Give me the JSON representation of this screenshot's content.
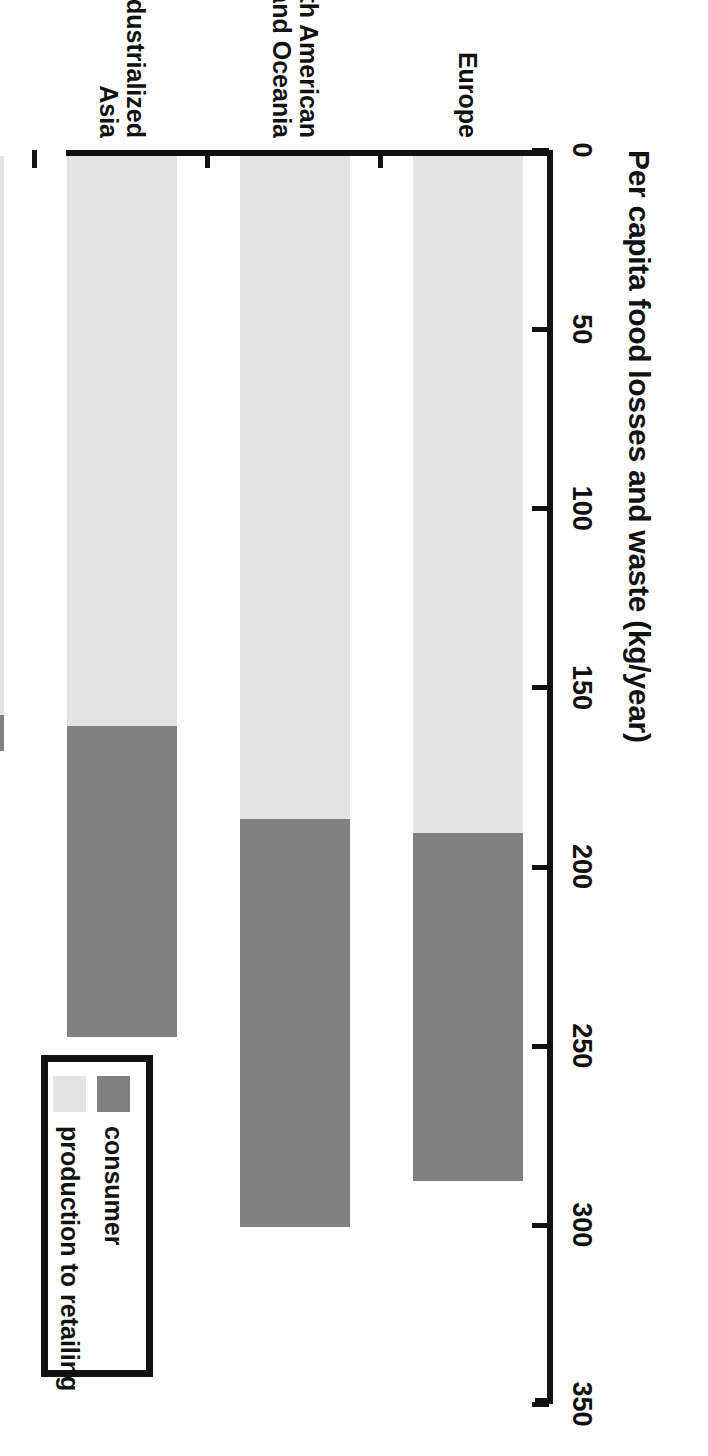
{
  "chart_data": {
    "type": "bar",
    "orientation": "horizontal-stacked",
    "title": "Per capita food losses and waste (kg/year)",
    "xlabel": "Per capita food losses and waste (kg/year)",
    "ylabel": "",
    "xlim": [
      0,
      350
    ],
    "xticks": [
      0,
      50,
      100,
      150,
      200,
      250,
      300,
      350
    ],
    "xtick_labels": [
      "0",
      "50",
      "100",
      "150",
      "200",
      "250",
      "300",
      "350"
    ],
    "grid": false,
    "legend_position": "bottom-right",
    "categories": [
      "Europe",
      "North American\nand Oceania",
      "Industrialized\nAsia",
      "Subsaharan\nAfrica",
      "North Africa,\nWest and\nCentral Asia",
      "South and\nSoutheast Asia",
      "Latin America"
    ],
    "series": [
      {
        "name": "production to retailing",
        "color": "#e3e3e3",
        "values": [
          189,
          185,
          159,
          156,
          179,
          113,
          204
        ]
      },
      {
        "name": "consumer",
        "color": "#808080",
        "values": [
          97,
          114,
          87,
          10,
          44,
          18,
          31
        ]
      }
    ],
    "totals": [
      286,
      299,
      246,
      166,
      223,
      131,
      235
    ]
  },
  "legend": {
    "items": [
      {
        "label": "consumer",
        "color": "#808080",
        "swatch": "consumer"
      },
      {
        "label": "production to retailing",
        "color": "#e3e3e3",
        "swatch": "production"
      }
    ]
  },
  "colors": {
    "consumer": "#808080",
    "production": "#e3e3e3",
    "axis": "#111111",
    "background": "#ffffff"
  }
}
